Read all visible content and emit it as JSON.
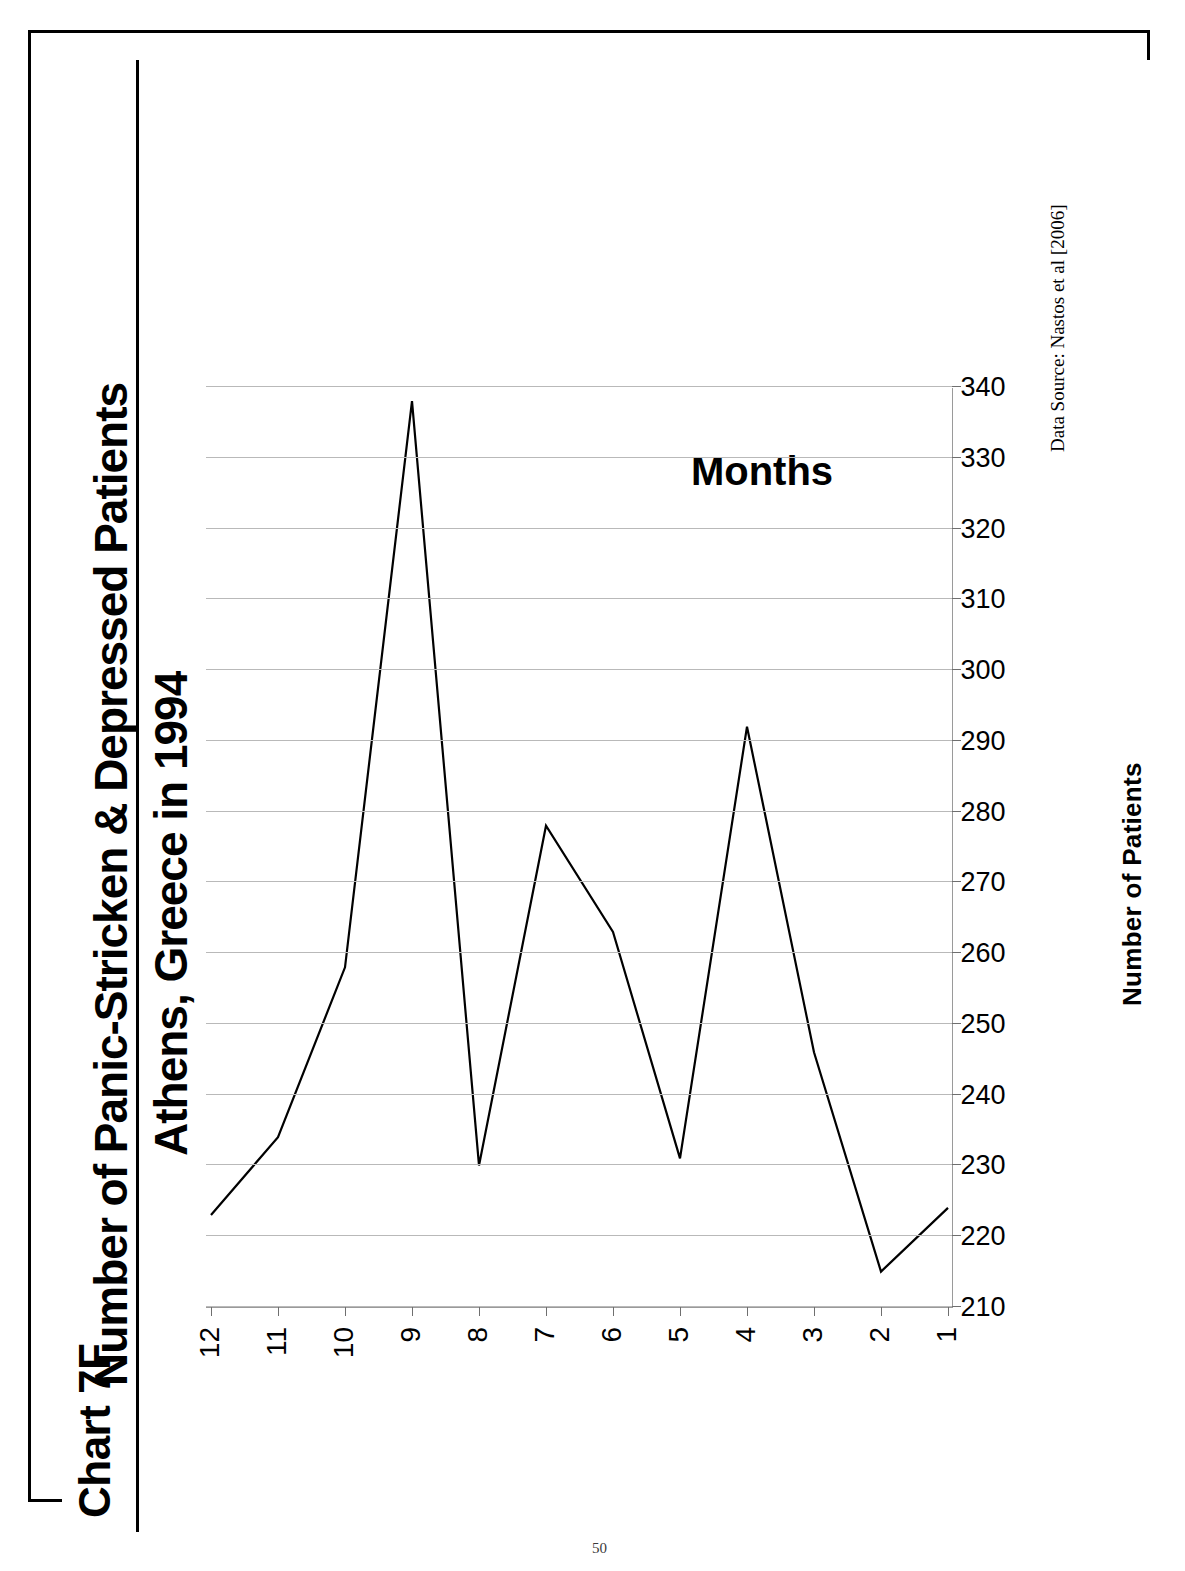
{
  "document": {
    "chart_label": "Chart 7F",
    "page_number": "50"
  },
  "chart_data": {
    "type": "line",
    "title": "Number of Panic-Stricken & Depressed Patients",
    "subtitle": "Athens, Greece in 1994",
    "xlabel": "Months",
    "ylabel": "Number of Patients",
    "source": "Data Source:  Nastos et al [2006]",
    "orientation": "rotated-90ccw",
    "grid": true,
    "legend": "none",
    "categories": [
      "1",
      "2",
      "3",
      "4",
      "5",
      "6",
      "7",
      "8",
      "9",
      "10",
      "11",
      "12"
    ],
    "x": [
      1,
      2,
      3,
      4,
      5,
      6,
      7,
      8,
      9,
      10,
      11,
      12
    ],
    "values": [
      224,
      215,
      246,
      292,
      231,
      263,
      278,
      230,
      338,
      258,
      234,
      223
    ],
    "series": [
      {
        "name": "Number of Patients",
        "values": [
          224,
          215,
          246,
          292,
          231,
          263,
          278,
          230,
          338,
          258,
          234,
          223
        ]
      }
    ],
    "ylim": [
      210,
      340
    ],
    "ytick_step": 10,
    "yticks": [
      "210",
      "220",
      "230",
      "240",
      "250",
      "260",
      "270",
      "280",
      "290",
      "300",
      "310",
      "320",
      "330",
      "340"
    ],
    "xticks": [
      "1",
      "2",
      "3",
      "4",
      "5",
      "6",
      "7",
      "8",
      "9",
      "10",
      "11",
      "12"
    ],
    "line_color": "#000000",
    "grid_color": "#b9b9b9",
    "axis_color": "#9a9a9a"
  }
}
